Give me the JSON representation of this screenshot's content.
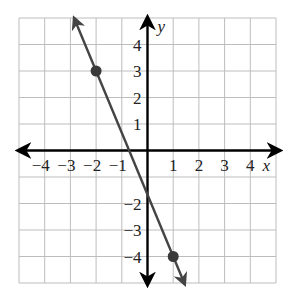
{
  "chart_data": {
    "type": "line",
    "title": "",
    "xlabel": "x",
    "ylabel": "y",
    "xlim": [
      -5,
      5
    ],
    "ylim": [
      -5,
      5
    ],
    "grid": true,
    "x_ticks": [
      -4,
      -3,
      -2,
      -1,
      1,
      2,
      3,
      4
    ],
    "y_ticks": [
      4,
      3,
      2,
      1,
      -2,
      -3,
      -4
    ],
    "x_tick_labels": [
      "−4",
      "−3",
      "−2",
      "−1",
      "1",
      "2",
      "3",
      "4"
    ],
    "y_tick_labels": [
      "4",
      "3",
      "2",
      "1",
      "−2",
      "−3",
      "−4"
    ],
    "series": [
      {
        "name": "line",
        "kind": "line-with-arrows",
        "slope": -2.3333,
        "intercept": -1.6667,
        "points": [
          {
            "x": -2,
            "y": 3
          },
          {
            "x": 1,
            "y": -4
          }
        ],
        "color": "#444444"
      }
    ],
    "legend": null
  },
  "style": {
    "grid_color": "#bdbdbd",
    "axis_color": "#000000",
    "line_color": "#444444",
    "point_color": "#3a3a3a"
  },
  "geometry": {
    "left": 19,
    "right": 276,
    "top": 18,
    "bottom": 283
  }
}
